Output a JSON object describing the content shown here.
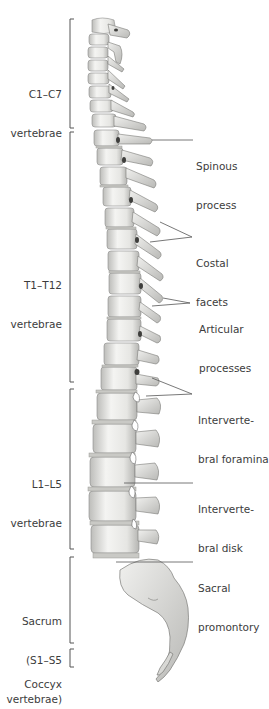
{
  "figure": {
    "top_caption_fragment": "(cut-off text)",
    "colors": {
      "background": "#ffffff",
      "bone_light": "#f2f2f0",
      "bone_mid": "#d9d9d6",
      "bone_shadow": "#a9a9a6",
      "bone_dark": "#5a5a58",
      "bracket": "#555555",
      "leader": "#555555",
      "text": "#3c3c3c"
    }
  },
  "regions": [
    {
      "id": "cervical",
      "label_line1": "C1–C7",
      "label_line2": "vertebrae",
      "label_line3": "",
      "bracket_top": 19,
      "bracket_bottom": 128
    },
    {
      "id": "thoracic",
      "label_line1": "T1–T12",
      "label_line2": "vertebrae",
      "label_line3": "",
      "bracket_top": 132,
      "bracket_bottom": 382
    },
    {
      "id": "lumbar",
      "label_line1": "L1–L5",
      "label_line2": "vertebrae",
      "label_line3": "",
      "bracket_top": 389,
      "bracket_bottom": 549
    },
    {
      "id": "sacrum",
      "label_line1": "Sacrum",
      "label_line2": "(S1–S5",
      "label_line3": "vertebrae)",
      "bracket_top": 557,
      "bracket_bottom": 643
    },
    {
      "id": "coccyx",
      "label_line1": "Coccyx",
      "label_line2": "",
      "label_line3": "",
      "bracket_top": 649,
      "bracket_bottom": 667
    }
  ],
  "annotations": [
    {
      "id": "spinous-process",
      "line1": "Spinous",
      "line2": "process"
    },
    {
      "id": "costal-facets",
      "line1": "Costal",
      "line2": "facets"
    },
    {
      "id": "articular-processes",
      "line1": "Articular",
      "line2": "processes"
    },
    {
      "id": "intervertebral-foramina",
      "line1": "Interverte-",
      "line2": "bral foramina"
    },
    {
      "id": "intervertebral-disk",
      "line1": "Interverte-",
      "line2": "bral disk"
    },
    {
      "id": "sacral-promontory",
      "line1": "Sacral",
      "line2": "promontory"
    }
  ]
}
